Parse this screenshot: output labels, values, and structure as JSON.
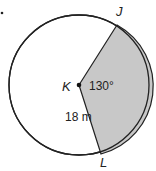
{
  "diagram": {
    "center_label": "K",
    "point_top": "J",
    "point_bottom": "L",
    "angle_label": "130°",
    "radius_label": "18 m",
    "shaded_color": "#c8c8c8",
    "stroke_color": "#222222"
  }
}
